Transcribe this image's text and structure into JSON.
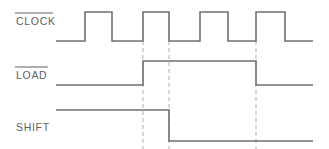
{
  "diagram": {
    "type": "digital-timing-waveform",
    "canvas": {
      "width": 329,
      "height": 149
    },
    "colors": {
      "background": "#ffffff",
      "waveform": "#707070",
      "marker": "#b9b9b9",
      "label_text": "#5f5f5f"
    },
    "signals": [
      {
        "id": "clock",
        "label": "CLOCK",
        "active_low": true,
        "overbar": true,
        "label_x": 16,
        "label_y": 25,
        "overbar_y": 13,
        "overbar_x1": 15,
        "overbar_x2": 53,
        "level_high_y": 12,
        "level_low_y": 41,
        "start_x": 56,
        "end_x": 313,
        "initial_level": "low",
        "transitions": [
          85,
          112,
          143,
          169,
          200,
          228,
          256,
          285
        ],
        "pulses": [
          {
            "rise": 85,
            "fall": 112
          },
          {
            "rise": 143,
            "fall": 169
          },
          {
            "rise": 200,
            "fall": 228
          },
          {
            "rise": 256,
            "fall": 285
          }
        ],
        "path": "M 56 41 L 85 41 L 85 12 L 112 12 L 112 41 L 143 41 L 143 12 L 169 12 L 169 41 L 200 41 L 200 12 L 228 12 L 228 41 L 256 41 L 256 12 L 285 12 L 285 41 L 313 41"
      },
      {
        "id": "load",
        "label": "LOAD",
        "active_low": true,
        "overbar": true,
        "label_x": 16,
        "label_y": 79,
        "overbar_y": 67,
        "overbar_x1": 15,
        "overbar_x2": 48,
        "level_high_y": 61,
        "level_low_y": 85,
        "start_x": 56,
        "end_x": 313,
        "initial_level": "low",
        "transitions": [
          143,
          256
        ],
        "pulses": [
          {
            "rise": 143,
            "fall": 256
          }
        ],
        "path": "M 56 85 L 143 85 L 143 61 L 256 61 L 256 85 L 313 85"
      },
      {
        "id": "shift",
        "label": "SHIFT",
        "active_low": false,
        "overbar": false,
        "label_x": 16,
        "label_y": 131,
        "level_high_y": 110,
        "level_low_y": 141,
        "start_x": 56,
        "end_x": 313,
        "initial_level": "high",
        "transitions": [
          169
        ],
        "pulses": [],
        "path": "M 56 110 L 169 110 L 169 141 L 313 141"
      }
    ],
    "markers": [
      {
        "id": "marker-1",
        "x": 143,
        "y1": 41,
        "y2": 149,
        "aligns_with": "clock-rise-2"
      },
      {
        "id": "marker-2",
        "x": 169,
        "y1": 41,
        "y2": 149,
        "aligns_with": "clock-fall-2"
      },
      {
        "id": "marker-3",
        "x": 256,
        "y1": 41,
        "y2": 149,
        "aligns_with": "clock-rise-4"
      }
    ]
  }
}
